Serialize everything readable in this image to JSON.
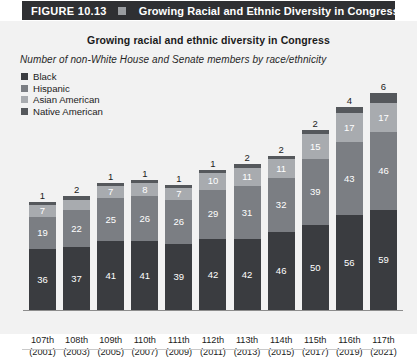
{
  "figure": {
    "number_label": "FIGURE 10.13",
    "banner_title": "Growing Racial and Ethnic Diversity in Congress",
    "banner_bg": "#2f3033",
    "banner_square_color": "#9a9da1"
  },
  "chart_data": {
    "type": "bar",
    "subtype": "stacked-bar",
    "title": "Growing racial and ethnic diversity in Congress",
    "subtitle": "Number of non-White House and Senate members by race/ethnicity",
    "xlabel": "",
    "ylabel": "",
    "grid": false,
    "legend_position": "top-left",
    "categories": [
      "107th (2001)",
      "108th (2003)",
      "109th (2005)",
      "110th (2007)",
      "111th (2009)",
      "112th (2011)",
      "113th (2013)",
      "114th (2015)",
      "115th (2017)",
      "116th (2019)",
      "117th (2021)"
    ],
    "category_lines": [
      [
        "107th",
        "(2001)"
      ],
      [
        "108th",
        "(2003)"
      ],
      [
        "109th",
        "(2005)"
      ],
      [
        "110th",
        "(2007)"
      ],
      [
        "111th",
        "(2009)"
      ],
      [
        "112th",
        "(2011)"
      ],
      [
        "113th",
        "(2013)"
      ],
      [
        "114th",
        "(2015)"
      ],
      [
        "115th",
        "(2017)"
      ],
      [
        "116th",
        "(2019)"
      ],
      [
        "117th",
        "(2021)"
      ]
    ],
    "series": [
      {
        "name": "Black",
        "color": "#3a3c40",
        "values": [
          36,
          37,
          41,
          41,
          39,
          42,
          42,
          46,
          50,
          56,
          59
        ]
      },
      {
        "name": "Hispanic",
        "color": "#7b7e83",
        "values": [
          19,
          22,
          25,
          26,
          26,
          29,
          31,
          32,
          39,
          43,
          46
        ]
      },
      {
        "name": "Asian American",
        "color": "#a8abaf",
        "values": [
          7,
          6,
          7,
          8,
          7,
          10,
          11,
          11,
          15,
          17,
          17
        ]
      },
      {
        "name": "Native American",
        "color": "#55585c",
        "values": [
          1,
          2,
          1,
          1,
          1,
          1,
          2,
          2,
          2,
          4,
          6
        ]
      }
    ],
    "totals": [
      63,
      67,
      74,
      76,
      73,
      82,
      86,
      91,
      106,
      120,
      128
    ],
    "ymax": 128
  },
  "colors": {
    "panel_bg": "#f2f2f2",
    "text": "#1b1b1b",
    "axis": "#8d8d8d"
  }
}
